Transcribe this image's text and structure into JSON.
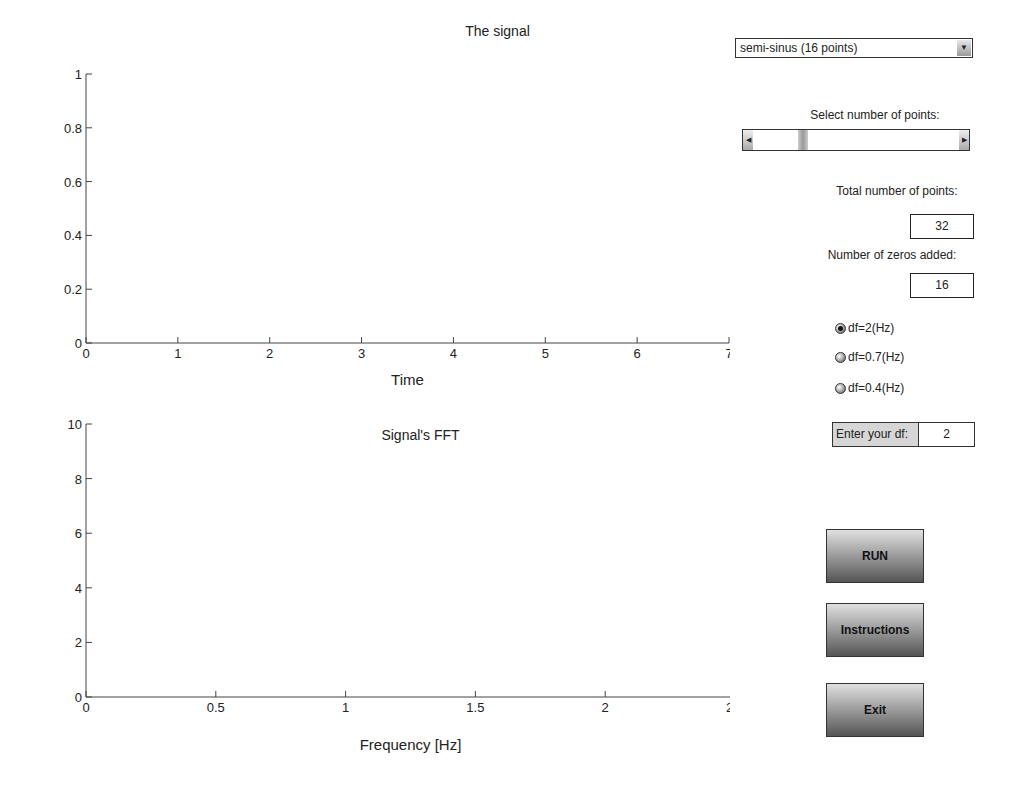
{
  "chart_data": [
    {
      "type": "scatter",
      "title": "The signal",
      "xlabel": "Time",
      "ylabel": "",
      "xlim": [
        0,
        7
      ],
      "ylim": [
        0,
        1
      ],
      "xticks": [
        0,
        1,
        2,
        3,
        4,
        5,
        6,
        7
      ],
      "yticks": [
        0,
        0.2,
        0.4,
        0.6,
        0.8,
        1
      ],
      "ytick_labels": [
        "0",
        "0.2",
        "0.4",
        "0.6",
        "0.8",
        "1"
      ],
      "series": [
        {
          "name": "signal",
          "marker": "*",
          "x": [
            0,
            0.209,
            0.419,
            0.628,
            0.838,
            1.047,
            1.257,
            1.466,
            1.676,
            1.885,
            2.094,
            2.304,
            2.513,
            2.723,
            2.932,
            3.142
          ],
          "y": [
            0,
            0.208,
            0.407,
            0.588,
            0.743,
            0.866,
            0.951,
            0.995,
            0.995,
            0.951,
            0.866,
            0.743,
            0.588,
            0.407,
            0.208,
            0
          ]
        },
        {
          "name": "zeros",
          "marker": "+",
          "x": [
            3.351,
            3.56,
            3.77,
            3.979,
            4.189,
            4.398,
            4.608,
            4.817,
            5.027,
            5.236,
            5.445,
            5.655,
            5.864,
            6.074,
            6.283,
            6.493
          ],
          "y": [
            0,
            0,
            0,
            0,
            0,
            0,
            0,
            0,
            0,
            0,
            0,
            0,
            0,
            0,
            0,
            0
          ]
        }
      ]
    },
    {
      "type": "scatter",
      "title": "Signal's FFT",
      "xlabel": "Frequency [Hz]",
      "ylabel": "Amplitude",
      "xlim": [
        0,
        2.5
      ],
      "ylim": [
        0,
        10
      ],
      "xticks": [
        0,
        0.5,
        1,
        1.5,
        2,
        2.5
      ],
      "yticks": [
        0,
        2,
        4,
        6,
        8,
        10
      ],
      "legend": {
        "position": "upper right",
        "entries": [
          "zeros",
          "signal"
        ]
      },
      "series": [
        {
          "name": "zeros",
          "marker": "+",
          "x": [
            0.149,
            0.448,
            0.746,
            1.045,
            1.343,
            1.642,
            1.94,
            2.239
          ],
          "y": [
            7.7,
            0.4,
            0.2,
            0.15,
            0.12,
            0.11,
            0.1,
            0.1
          ]
        },
        {
          "name": "signal",
          "marker": "*",
          "x": [
            0,
            0.298,
            0.597,
            0.895,
            1.194,
            1.492,
            1.791,
            2.089
          ],
          "y": [
            9.5,
            3.75,
            0.7,
            0.28,
            0.15,
            0.08,
            0.04,
            0.02
          ]
        }
      ]
    }
  ],
  "controls": {
    "signal_select": {
      "value": "semi-sinus (16 points)"
    },
    "select_points_label": "Select  number of points:",
    "total_points_label": "Total number of points:",
    "total_points_value": "32",
    "zeros_added_label": "Number of zeros added:",
    "zeros_added_value": "16",
    "radios": [
      {
        "label": "df=2(Hz)",
        "selected": true
      },
      {
        "label": "df=0.7(Hz)",
        "selected": false
      },
      {
        "label": "df=0.4(Hz)",
        "selected": false
      }
    ],
    "df_input": {
      "label": "Enter your df:",
      "value": "2"
    },
    "run_label": "RUN",
    "instructions_label": "Instructions",
    "exit_label": "Exit"
  }
}
